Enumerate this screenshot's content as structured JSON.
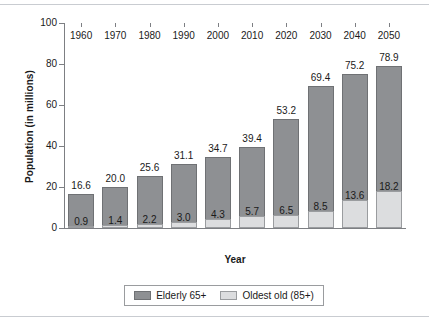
{
  "figure": {
    "background": "#ffffff",
    "rule_color": "#c9ccd1"
  },
  "chart_data": {
    "type": "bar",
    "stacked": true,
    "title": "",
    "xlabel": "Year",
    "ylabel": "Population (in millions)",
    "ylim": [
      0,
      100
    ],
    "yticks": [
      0,
      20,
      40,
      60,
      80,
      100
    ],
    "ytick_labels": [
      "0",
      "20",
      "40",
      "60",
      "80",
      "100"
    ],
    "grid": false,
    "legend_position": "bottom",
    "categories": [
      "1960",
      "1970",
      "1980",
      "1990",
      "2000",
      "2010",
      "2020",
      "2030",
      "2040",
      "2050"
    ],
    "series": [
      {
        "name": "Elderly 65+",
        "color": "#8e9093",
        "edge_color": "#6f7174",
        "values": [
          16.6,
          20.0,
          25.6,
          31.1,
          34.7,
          39.4,
          53.2,
          69.4,
          75.2,
          78.9
        ],
        "value_labels": [
          "16.6",
          "20.0",
          "25.6",
          "31.1",
          "34.7",
          "39.4",
          "53.2",
          "69.4",
          "75.2",
          "78.9"
        ],
        "label_position": "above-bar-total"
      },
      {
        "name": "Oldest old (85+)",
        "color": "#dcdddf",
        "edge_color": "#9a9c9f",
        "values": [
          0.9,
          1.4,
          2.2,
          3.0,
          4.3,
          5.7,
          6.5,
          8.5,
          13.6,
          18.2
        ],
        "value_labels": [
          "0.9",
          "1.4",
          "2.2",
          "3.0",
          "4.3",
          "5.7",
          "6.5",
          "8.5",
          "13.6",
          "18.2"
        ],
        "label_position": "inside-bar-above-segment"
      }
    ]
  },
  "legend": {
    "items": [
      {
        "label": "Elderly 65+",
        "swatch": "dark"
      },
      {
        "label": "Oldest old (85+)",
        "swatch": "light"
      }
    ]
  }
}
